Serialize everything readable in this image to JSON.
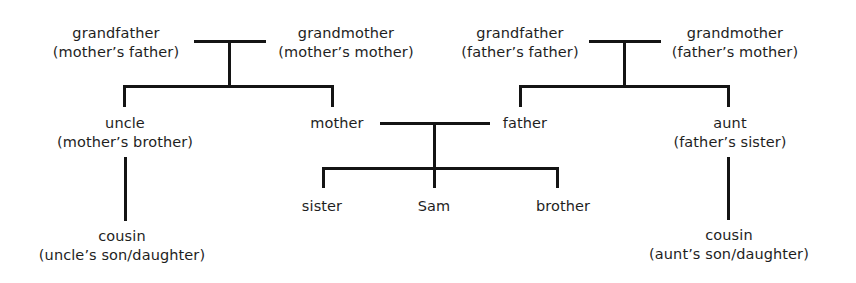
{
  "diagram": {
    "title": "",
    "type": "family-tree",
    "line_color": "#141414",
    "text_color": "#1e1e1e",
    "background": "#ffffff",
    "nodes": {
      "grandfather_maternal": {
        "label": "grandfather",
        "sublabel": "(mother’s father)"
      },
      "grandmother_maternal": {
        "label": "grandmother",
        "sublabel": "(mother’s mother)"
      },
      "grandfather_paternal": {
        "label": "grandfather",
        "sublabel": "(father’s father)"
      },
      "grandmother_paternal": {
        "label": "grandmother",
        "sublabel": "(father’s mother)"
      },
      "uncle": {
        "label": "uncle",
        "sublabel": "(mother’s brother)"
      },
      "mother": {
        "label": "mother"
      },
      "father": {
        "label": "father"
      },
      "aunt": {
        "label": "aunt",
        "sublabel": "(father’s sister)"
      },
      "sister": {
        "label": "sister"
      },
      "sam": {
        "label": "Sam"
      },
      "brother": {
        "label": "brother"
      },
      "cousin_maternal": {
        "label": "cousin",
        "sublabel": "(uncle’s son/daughter)"
      },
      "cousin_paternal": {
        "label": "cousin",
        "sublabel": "(aunt’s son/daughter)"
      }
    },
    "relationships": [
      {
        "type": "marriage",
        "between": [
          "grandfather_maternal",
          "grandmother_maternal"
        ],
        "children": [
          "uncle",
          "mother"
        ]
      },
      {
        "type": "marriage",
        "between": [
          "grandfather_paternal",
          "grandmother_paternal"
        ],
        "children": [
          "father",
          "aunt"
        ]
      },
      {
        "type": "marriage",
        "between": [
          "mother",
          "father"
        ],
        "children": [
          "sister",
          "sam",
          "brother"
        ]
      },
      {
        "type": "parent-child",
        "parent": "uncle",
        "children": [
          "cousin_maternal"
        ]
      },
      {
        "type": "parent-child",
        "parent": "aunt",
        "children": [
          "cousin_paternal"
        ]
      }
    ]
  }
}
